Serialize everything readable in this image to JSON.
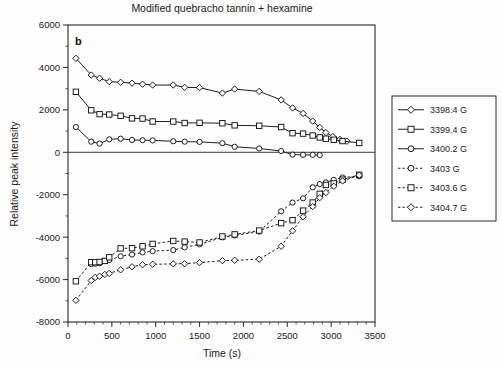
{
  "figure": {
    "panel_label": "b",
    "title": "Modified quebracho tannin + hexamine"
  },
  "chart_data": {
    "type": "line",
    "title": "Modified quebracho tannin + hexamine",
    "xlabel": "Time (s)",
    "ylabel": "Relative peak intensity",
    "xlim": [
      0,
      3500
    ],
    "ylim": [
      -8000,
      6000
    ],
    "xticks": [
      0,
      500,
      1000,
      1500,
      2000,
      2500,
      3000,
      3500
    ],
    "yticks": [
      -8000,
      -6000,
      -4000,
      -2000,
      0,
      2000,
      4000,
      6000
    ],
    "xtick_labels": [
      "0",
      "500",
      "1000",
      "1500",
      "2000",
      "2500",
      "3000",
      "3500"
    ],
    "ytick_labels": [
      "-8000",
      "-6000",
      "-4000",
      "-2000",
      "0",
      "2000",
      "4000",
      "6000"
    ],
    "x_minor_ticks_per_interval": 5,
    "y_minor_ticks_per_interval": 2,
    "grid": false,
    "legend_position": "right-outside",
    "series": [
      {
        "name": "3398.4 G",
        "marker": "diamond",
        "linestyle": "solid",
        "x": [
          90,
          265,
          360,
          470,
          600,
          730,
          850,
          965,
          1200,
          1330,
          1500,
          1760,
          1900,
          2180,
          2430,
          2560,
          2680,
          2790,
          2870,
          2940,
          3020,
          3100,
          3180
        ],
        "y": [
          4430,
          3640,
          3490,
          3330,
          3300,
          3260,
          3210,
          3170,
          3170,
          3060,
          3050,
          2790,
          2980,
          2870,
          2470,
          2090,
          1830,
          1470,
          1170,
          930,
          740,
          610,
          520
        ]
      },
      {
        "name": "3399.4 G",
        "marker": "square",
        "linestyle": "solid",
        "x": [
          90,
          265,
          360,
          470,
          600,
          730,
          850,
          965,
          1200,
          1330,
          1500,
          1760,
          1900,
          2180,
          2430,
          2560,
          2680,
          2790,
          2870,
          2940,
          3030,
          3130,
          3320
        ],
        "y": [
          2850,
          1980,
          1800,
          1780,
          1720,
          1600,
          1590,
          1450,
          1450,
          1380,
          1390,
          1370,
          1270,
          1250,
          1190,
          900,
          880,
          790,
          700,
          640,
          590,
          530,
          440
        ]
      },
      {
        "name": "3400.2 G",
        "marker": "circle",
        "linestyle": "solid",
        "x": [
          90,
          265,
          360,
          470,
          600,
          730,
          850,
          965,
          1200,
          1330,
          1500,
          1760,
          1900,
          2180,
          2430,
          2560,
          2680,
          2790,
          2870
        ],
        "y": [
          1190,
          500,
          410,
          610,
          640,
          580,
          570,
          560,
          520,
          500,
          490,
          430,
          260,
          180,
          60,
          -110,
          -120,
          -120,
          -130
        ]
      },
      {
        "name": "3403 G",
        "marker": "circle",
        "linestyle": "dashed",
        "x": [
          265,
          310,
          360,
          420,
          470,
          600,
          730,
          850,
          965,
          1200,
          1330,
          1500,
          1760,
          1900,
          2180,
          2430,
          2560,
          2680,
          2790,
          2870,
          2940,
          3030,
          3130,
          3320
        ],
        "y": [
          -5270,
          -5250,
          -5230,
          -5120,
          -5080,
          -4900,
          -4820,
          -4720,
          -4660,
          -4610,
          -4480,
          -4340,
          -4010,
          -3920,
          -3740,
          -2780,
          -2370,
          -2170,
          -1650,
          -1500,
          -1420,
          -1300,
          -1190,
          -1130
        ]
      },
      {
        "name": "3403.6 G",
        "marker": "square",
        "linestyle": "dashed",
        "x": [
          90,
          265,
          310,
          360,
          420,
          470,
          600,
          730,
          850,
          965,
          1200,
          1330,
          1500,
          1760,
          1900,
          2180,
          2430,
          2560,
          2680,
          2790,
          2870,
          2940,
          3030,
          3130,
          3320
        ],
        "y": [
          -6080,
          -5180,
          -5180,
          -5170,
          -5120,
          -4950,
          -4530,
          -4520,
          -4430,
          -4320,
          -4180,
          -4210,
          -4250,
          -3970,
          -3870,
          -3690,
          -3340,
          -3200,
          -2750,
          -2370,
          -1960,
          -1540,
          -1470,
          -1290,
          -1060
        ]
      },
      {
        "name": "3404.7 G",
        "marker": "diamond",
        "linestyle": "dashed",
        "x": [
          90,
          265,
          310,
          360,
          420,
          470,
          600,
          730,
          850,
          965,
          1200,
          1330,
          1500,
          1760,
          1900,
          2180,
          2430,
          2560,
          2680,
          2790,
          2870,
          2940,
          3030,
          3130,
          3320
        ],
        "y": [
          -6980,
          -6050,
          -5900,
          -5840,
          -5760,
          -5710,
          -5540,
          -5400,
          -5300,
          -5280,
          -5260,
          -5250,
          -5200,
          -5110,
          -5090,
          -5040,
          -4430,
          -3700,
          -3040,
          -2560,
          -2140,
          -1900,
          -1600,
          -1350,
          -1080
        ]
      }
    ],
    "legend_entries": [
      {
        "label": "3398.4 G",
        "marker": "diamond",
        "linestyle": "solid"
      },
      {
        "label": "3399.4 G",
        "marker": "square",
        "linestyle": "solid"
      },
      {
        "label": "3400.2 G",
        "marker": "circle",
        "linestyle": "solid"
      },
      {
        "label": "3403 G",
        "marker": "circle",
        "linestyle": "dashed"
      },
      {
        "label": "3403.6 G",
        "marker": "square",
        "linestyle": "dashed"
      },
      {
        "label": "3404.7 G",
        "marker": "diamond",
        "linestyle": "dashed"
      }
    ]
  }
}
